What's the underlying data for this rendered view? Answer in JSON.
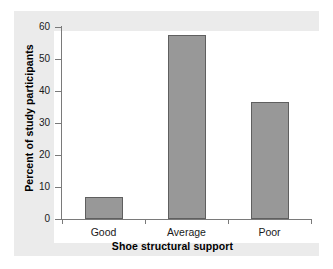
{
  "chart_data": {
    "type": "bar",
    "title": "",
    "subtitle": "",
    "categories": [
      "Good",
      "Average",
      "Poor"
    ],
    "values": [
      7,
      57.5,
      36.5
    ],
    "xlabel": "Shoe structural support",
    "ylabel": "Percent of study participants",
    "ylim": [
      0,
      60
    ],
    "yticks": [
      0,
      10,
      20,
      30,
      40,
      50,
      60
    ],
    "ytick_labels": [
      "0",
      "10",
      "20",
      "30",
      "40",
      "50",
      "60"
    ],
    "grid": false,
    "legend": null,
    "legend_position": "none",
    "annotations": [],
    "colors": {
      "bar_fill": "#989898",
      "bar_edge": "#5f5f5f",
      "axis": "#7a7a7a",
      "text": "#1a1a1a",
      "title_text": "#000000",
      "plot_background": "#ffffff",
      "panel_background": "#ebebeb",
      "figure_background": "#ffffff"
    }
  }
}
